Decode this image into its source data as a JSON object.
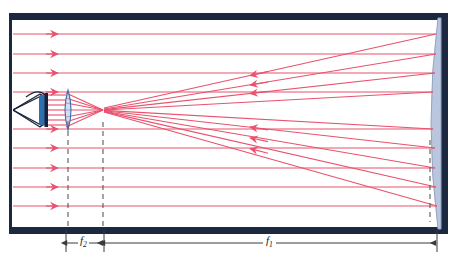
{
  "diagram": {
    "type": "optical-ray-diagram",
    "canvas": {
      "width": 460,
      "height": 269
    },
    "colors": {
      "ray": "#e8526e",
      "ray_light": "#f2a3b4",
      "frame": "#1b2840",
      "mirror_fill": "#b9c6dd",
      "mirror_edge": "#8fa2c2",
      "lens_fill": "#a9c6e8",
      "lens_edge": "#3f6fa8",
      "eye_dark": "#16213a",
      "eye_iris": "#2f6fae",
      "dash": "#5a5a5a",
      "dim_line": "#3b3b3b",
      "background": "#ffffff"
    },
    "frame": {
      "name": "enclosure-tube",
      "left": 9,
      "top": 13,
      "right": 448,
      "bottom": 234,
      "border_width": 7
    },
    "mirror": {
      "name": "concave-primary-mirror",
      "x_edge": 437,
      "x_vertex": 424,
      "top": 18,
      "bottom": 229,
      "description": "concave primary mirror, curved reflective surface at right end"
    },
    "lens": {
      "name": "eyepiece-lens",
      "x": 68,
      "cy": 110,
      "half_height": 20,
      "bulge": 5,
      "description": "biconvex eyepiece lens"
    },
    "eye": {
      "name": "observer-eye",
      "x": 20,
      "y": 110,
      "description": "observer eye viewing through eyepiece"
    },
    "focal_point": {
      "name": "focal-point",
      "x": 103,
      "y": 110
    },
    "dashed_lines": [
      {
        "name": "dashed-line-lens",
        "x": 68,
        "y1": 122,
        "y2": 226
      },
      {
        "name": "dashed-line-focus",
        "x": 103,
        "y1": 122,
        "y2": 226
      },
      {
        "name": "dashed-line-mirror-axis",
        "x": 430,
        "y1": 140,
        "y2": 222
      }
    ],
    "incoming_rays": {
      "name": "incoming-parallel-rays",
      "arrow_x": 55,
      "x_start": 12,
      "ys_top": [
        34,
        54,
        73,
        92
      ],
      "ys_bottom": [
        129,
        148,
        168,
        187,
        206
      ],
      "direction": "rightward"
    },
    "reflected_rays": {
      "name": "reflected-converging-rays",
      "arrow_x_upper": 248,
      "arrow_x_lower": 248,
      "direction": "leftward-converging-to-focus"
    },
    "dimensions": [
      {
        "name": "dimension-f2",
        "label": "f",
        "subscript": "2",
        "x_left": 66,
        "x_right": 104,
        "y": 243
      },
      {
        "name": "dimension-f1",
        "label": "f",
        "subscript": "1",
        "x_left": 104,
        "x_right": 437,
        "y": 243
      }
    ]
  }
}
